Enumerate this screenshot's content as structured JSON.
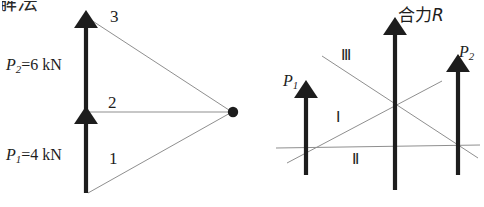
{
  "page": {
    "width": 484,
    "height": 207,
    "background": "#ffffff",
    "ink": "#1d1d1d",
    "thin_line": "#8f8f8f"
  },
  "heading": {
    "text": "解法",
    "note": "partially cropped at top-left edge"
  },
  "left_diagram": {
    "name": "force-polygon-diagram",
    "force_labels": [
      {
        "id": "P2",
        "symbol": "P",
        "subscript": "2",
        "equals": "=",
        "value": "6",
        "unit": "kN",
        "text": "P2=6 kN"
      },
      {
        "id": "P1",
        "symbol": "P",
        "subscript": "1",
        "equals": "=",
        "value": "4",
        "unit": "kN",
        "text": "P1=4 kN"
      }
    ],
    "ray_labels": [
      {
        "id": "3",
        "text": "3"
      },
      {
        "id": "2",
        "text": "2"
      },
      {
        "id": "1",
        "text": "1"
      }
    ],
    "pole_point": {
      "label": "",
      "x": 233,
      "y": 112
    },
    "vectors": [
      {
        "id": "P2",
        "x": 86,
        "y_tail": 112,
        "y_head": 18,
        "magnitude_kn": 6
      },
      {
        "id": "P1",
        "x": 86,
        "y_tail": 193,
        "y_head": 114,
        "magnitude_kn": 4
      }
    ]
  },
  "right_diagram": {
    "name": "funicular-polygon-diagram",
    "resultant_label": {
      "text": "合力R",
      "chinese": "合力",
      "symbol": "R"
    },
    "force_labels": [
      {
        "id": "P1",
        "symbol": "P",
        "subscript": "1",
        "text": "P1"
      },
      {
        "id": "P2",
        "symbol": "P",
        "subscript": "2",
        "text": "P2"
      }
    ],
    "string_labels": [
      {
        "id": "III",
        "text": "Ⅲ"
      },
      {
        "id": "I",
        "text": "Ⅰ"
      },
      {
        "id": "II",
        "text": "Ⅱ"
      }
    ],
    "vectors": [
      {
        "id": "P1",
        "x": 306,
        "y_tail": 175,
        "y_head": 88
      },
      {
        "id": "R",
        "x": 395,
        "y_tail": 190,
        "y_head": 25
      },
      {
        "id": "P2",
        "x": 458,
        "y_tail": 175,
        "y_head": 62
      }
    ]
  }
}
